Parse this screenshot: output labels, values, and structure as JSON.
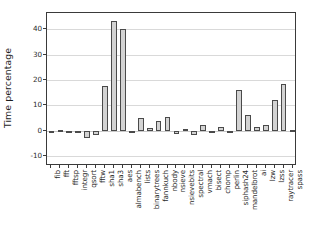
{
  "chart_data": {
    "type": "bar",
    "title": "",
    "xlabel": "",
    "ylabel": "Time percentage",
    "ylim": [
      -14,
      46.5
    ],
    "yticks": [
      -10,
      0,
      10,
      20,
      30,
      40
    ],
    "ytick_labels": [
      "-10",
      "0",
      "10",
      "20",
      "30",
      "40"
    ],
    "grid": true,
    "legend": "none",
    "bar_facecolor": "#d3d3d3",
    "bar_edgecolor": "#4a4a4a",
    "categories": [
      "fib",
      "fft",
      "fftsp",
      "integr",
      "qsort",
      "fftw",
      "sha1",
      "sha3",
      "aes",
      "almabench",
      "lists",
      "binarytrees",
      "fannkuch",
      "nbody",
      "nsieve",
      "nsievebits",
      "spectral",
      "vmach",
      "bisect",
      "chomp",
      "perlin",
      "siphash24",
      "mandelbrot",
      "ai",
      "lzw",
      "lzss",
      "raytracer",
      "spass"
    ],
    "values": [
      -0.2,
      0.4,
      -0.6,
      -0.4,
      -3.0,
      -1.6,
      17.7,
      43.5,
      40.2,
      -0.5,
      5.1,
      1.0,
      3.9,
      5.3,
      -1.3,
      0.8,
      -1.6,
      2.4,
      -0.4,
      1.5,
      -0.3,
      16.1,
      6.1,
      1.4,
      2.3,
      12.0,
      18.5,
      0.2
    ]
  }
}
